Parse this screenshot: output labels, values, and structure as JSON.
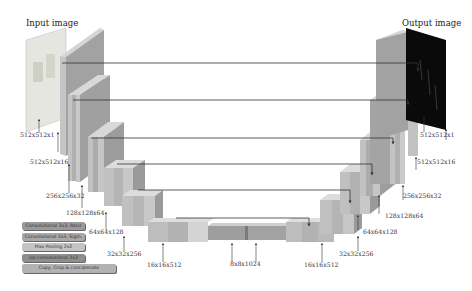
{
  "titles": {
    "input": "Input image",
    "output": "Output image"
  },
  "encoder_labels": [
    "512x512x1",
    "512x512x16",
    "256x256x32",
    "128x128x64",
    "64x64x128",
    "32x32x256",
    "16x16x512"
  ],
  "bottleneck_label": "8x8x1024",
  "decoder_labels": [
    "16x16x512",
    "32x32x256",
    "64x64x128",
    "128x128x64",
    "256x256x32",
    "512x512x16",
    "512x512x1"
  ],
  "legend": [
    {
      "label": "Convolutional 3x3, ReLU",
      "color": "#9a9a9a"
    },
    {
      "label": "Convolutional 3x3, Sigm.",
      "color": "#a8a8a8"
    },
    {
      "label": "Max Pooling 2x2",
      "color": "#c4c4c4"
    },
    {
      "label": "Up-convolutional 2x2",
      "color": "#8e8e8e"
    },
    {
      "label": "Copy, Crop & concatenate",
      "color": "#b2b2b2"
    }
  ],
  "colors": {
    "block_front": "#b9b9b9",
    "block_side": "#8f8f8f",
    "block_top": "#d6d6d6",
    "skip_line": "#333333",
    "output_image": "#0a0a0a"
  }
}
